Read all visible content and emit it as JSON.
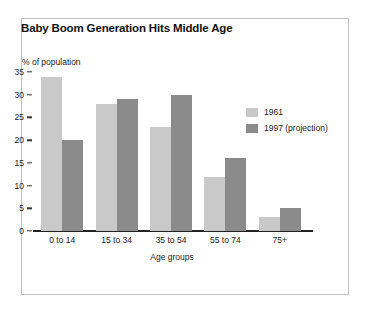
{
  "panel": {
    "border_color": "#c0c0c0",
    "background": "#ffffff"
  },
  "chart_data": {
    "type": "bar",
    "title": "Baby Boom Generation Hits Middle Age",
    "xlabel": "Age groups",
    "ylabel": "% of population",
    "categories": [
      "0 to 14",
      "15 to 34",
      "35 to 54",
      "55 to 74",
      "75+"
    ],
    "series": [
      {
        "name": "1961",
        "color": "#c9c9c9",
        "values": [
          34,
          28,
          23,
          12,
          3
        ]
      },
      {
        "name": "1997 (projection)",
        "color": "#8b8b8b",
        "values": [
          20,
          29,
          30,
          16,
          5
        ]
      }
    ],
    "ylim": [
      0,
      35
    ],
    "yticks": [
      0,
      5,
      10,
      15,
      20,
      25,
      30,
      35
    ],
    "ytick_labels": [
      "0",
      "5",
      "10",
      "15",
      "20",
      "25",
      "30",
      "35"
    ],
    "grid": false,
    "legend_position": "upper right"
  }
}
